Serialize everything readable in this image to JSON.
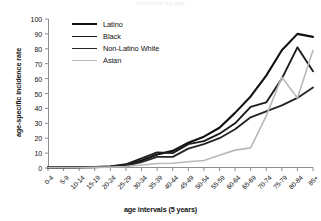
{
  "figure": {
    "cropped_title": "incidence by age",
    "ylabel": "age-specific incidence rate",
    "xlabel": "age intervals (5 years)"
  },
  "legend": {
    "position": "upper-left-inside",
    "items": [
      {
        "label": "Latino",
        "color": "#111111",
        "width": 2.1
      },
      {
        "label": "Black",
        "color": "#1c1c1c",
        "width": 1.9
      },
      {
        "label": "Non-Latino White",
        "color": "#262626",
        "width": 1.9
      },
      {
        "label": "Asian",
        "color": "#b8b8b8",
        "width": 1.6
      }
    ]
  },
  "chart_data": {
    "type": "line",
    "title": "incidence by age",
    "xlabel": "age intervals (5 years)",
    "ylabel": "age-specific incidence rate",
    "ylim": [
      0,
      100
    ],
    "ytick_step": 10,
    "yticks": [
      0,
      10,
      20,
      30,
      40,
      50,
      60,
      70,
      80,
      90,
      100
    ],
    "grid": false,
    "legend_position": "upper-left-inside",
    "categories": [
      "0-4",
      "5-9",
      "10-14",
      "15-19",
      "20-24",
      "25-29",
      "30-34",
      "35-39",
      "40-44",
      "45-49",
      "50-54",
      "55-59",
      "60-64",
      "65-69",
      "70-74",
      "75-79",
      "80-84",
      "85+"
    ],
    "series": [
      {
        "name": "Latino",
        "color": "#111111",
        "width": 2.1,
        "values": [
          0.4,
          0.4,
          0.5,
          0.6,
          1.0,
          2.0,
          5.0,
          9.0,
          11.5,
          17.0,
          21.0,
          27.0,
          37.0,
          48.0,
          62.0,
          79.0,
          90.0,
          88.0
        ]
      },
      {
        "name": "Black",
        "color": "#1c1c1c",
        "width": 1.9,
        "values": [
          0.4,
          0.4,
          0.5,
          0.6,
          1.0,
          2.5,
          6.5,
          10.5,
          10.0,
          16.0,
          18.0,
          23.0,
          30.0,
          41.0,
          44.0,
          60.0,
          81.0,
          65.0
        ]
      },
      {
        "name": "Non-Latino White",
        "color": "#262626",
        "width": 1.9,
        "values": [
          0.4,
          0.4,
          0.5,
          0.6,
          0.9,
          1.6,
          4.0,
          7.5,
          7.5,
          13.0,
          16.0,
          20.0,
          26.0,
          34.0,
          38.0,
          42.0,
          47.0,
          54.0
        ]
      },
      {
        "name": "Asian",
        "color": "#b8b8b8",
        "width": 1.6,
        "values": [
          0.3,
          0.3,
          0.3,
          0.4,
          0.6,
          1.0,
          2.0,
          3.0,
          3.2,
          4.2,
          5.0,
          8.5,
          12.0,
          13.5,
          35.0,
          61.0,
          47.0,
          79.0
        ]
      }
    ]
  }
}
